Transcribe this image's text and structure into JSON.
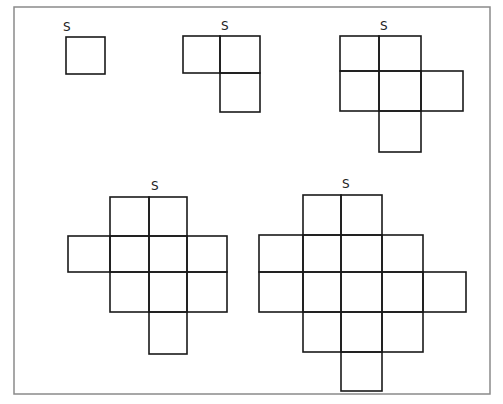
{
  "frame": {
    "x": 14,
    "y": 7,
    "w": 476,
    "h": 387,
    "stroke": "#8a8a8a"
  },
  "stroke_color": "#1a1a1a",
  "label_text": "S",
  "shapes": [
    {
      "name": "shape-1",
      "label": "S",
      "label_pos": [
        63,
        31
      ],
      "xs": [
        66,
        105
      ],
      "ys": [
        37,
        74
      ],
      "cells": [
        [
          0,
          0
        ]
      ]
    },
    {
      "name": "shape-2",
      "label": "S",
      "label_pos": [
        221,
        30
      ],
      "xs": [
        183,
        220,
        260
      ],
      "ys": [
        36,
        73,
        112
      ],
      "cells": [
        [
          0,
          0
        ],
        [
          0,
          1
        ],
        [
          1,
          1
        ]
      ]
    },
    {
      "name": "shape-3",
      "label": "S",
      "label_pos": [
        380,
        30
      ],
      "xs": [
        340,
        379,
        421,
        463
      ],
      "ys": [
        36,
        71,
        111,
        152
      ],
      "cells": [
        [
          0,
          0
        ],
        [
          0,
          1
        ],
        [
          1,
          0
        ],
        [
          1,
          1
        ],
        [
          1,
          2
        ],
        [
          2,
          1
        ]
      ]
    },
    {
      "name": "shape-4",
      "label": "S",
      "label_pos": [
        151,
        190
      ],
      "xs": [
        68,
        110,
        149,
        187,
        227
      ],
      "ys": [
        197,
        236,
        272,
        312,
        354
      ],
      "cells": [
        [
          0,
          1
        ],
        [
          0,
          2
        ],
        [
          1,
          0
        ],
        [
          1,
          1
        ],
        [
          1,
          2
        ],
        [
          1,
          3
        ],
        [
          2,
          1
        ],
        [
          2,
          2
        ],
        [
          2,
          3
        ],
        [
          3,
          2
        ]
      ]
    },
    {
      "name": "shape-5",
      "label": "S",
      "label_pos": [
        342,
        188
      ],
      "xs": [
        259,
        303,
        341,
        382,
        423,
        466
      ],
      "ys": [
        195,
        235,
        272,
        312,
        352,
        391
      ],
      "cells": [
        [
          0,
          1
        ],
        [
          0,
          2
        ],
        [
          1,
          0
        ],
        [
          1,
          1
        ],
        [
          1,
          2
        ],
        [
          1,
          3
        ],
        [
          2,
          0
        ],
        [
          2,
          1
        ],
        [
          2,
          2
        ],
        [
          2,
          3
        ],
        [
          2,
          4
        ],
        [
          3,
          1
        ],
        [
          3,
          2
        ],
        [
          3,
          3
        ],
        [
          4,
          2
        ]
      ]
    }
  ]
}
